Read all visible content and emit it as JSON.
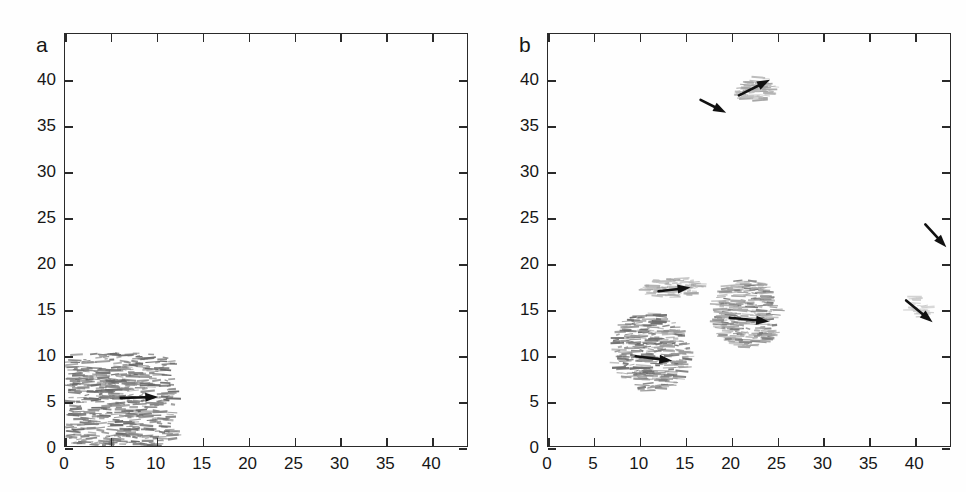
{
  "figure": {
    "background": "#fefefe",
    "axis_color": "#2a2a2a",
    "arrow_color": "#111111",
    "dash_color_dark": "#6f6f6f",
    "dash_color_light": "#a8a8a8"
  },
  "panels": [
    {
      "id": "a",
      "letter": "a"
    },
    {
      "id": "b",
      "letter": "b"
    }
  ],
  "chart_data": [
    {
      "type": "scatter",
      "panel": "a",
      "title": "a",
      "xlabel": "",
      "ylabel": "",
      "xlim": [
        0,
        44
      ],
      "ylim": [
        0,
        45
      ],
      "xticks": [
        0,
        5,
        10,
        15,
        20,
        25,
        30,
        35,
        40
      ],
      "yticks": [
        0,
        5,
        10,
        15,
        20,
        25,
        30,
        35,
        40
      ],
      "xticklabels": [
        "0",
        "5",
        "10",
        "15",
        "20",
        "25",
        "30",
        "35",
        "40"
      ],
      "yticklabels": [
        "0",
        "5",
        "10",
        "15",
        "20",
        "25",
        "30",
        "35",
        "40"
      ],
      "grid": false,
      "legend": "none",
      "marker_style": "short horizontal dash segments (streaks)",
      "clusters": [
        {
          "name": "main-cluster",
          "x_range": [
            0.4,
            11.9
          ],
          "y_range": [
            0.0,
            10.1
          ],
          "shade": "dark",
          "count": 520,
          "shape": "rectangular dense block"
        }
      ],
      "arrows": [
        {
          "name": "cluster-a-velocity-arrow",
          "x0": 6.1,
          "y0": 5.25,
          "x1": 10.2,
          "y1": 5.35
        }
      ]
    },
    {
      "type": "scatter",
      "panel": "b",
      "title": "b",
      "xlabel": "",
      "ylabel": "",
      "xlim": [
        0,
        44
      ],
      "ylim": [
        0,
        45
      ],
      "xticks": [
        0,
        5,
        10,
        15,
        20,
        25,
        30,
        35,
        40
      ],
      "yticks": [
        0,
        5,
        10,
        15,
        20,
        25,
        30,
        35,
        40
      ],
      "xticklabels": [
        "0",
        "5",
        "10",
        "15",
        "20",
        "25",
        "30",
        "35",
        "40"
      ],
      "yticklabels": [
        "0",
        "5",
        "10",
        "15",
        "20",
        "25",
        "30",
        "35",
        "40"
      ],
      "grid": false,
      "legend": "none",
      "marker_style": "short horizontal dash segments (streaks)",
      "clusters": [
        {
          "name": "upper-cluster",
          "x_center": 22.6,
          "y_center": 38.9,
          "x_range": [
            20.6,
            25.0
          ],
          "y_range": [
            37.6,
            40.2
          ],
          "shade": "light",
          "count": 60,
          "tilt_deg": 22,
          "shape": "small elongated blob tilted up-right"
        },
        {
          "name": "mid-left-cluster",
          "x_center": 11.0,
          "y_center": 10.4,
          "x_range": [
            7.0,
            15.5
          ],
          "y_range": [
            6.0,
            14.5
          ],
          "shade": "mixed-dark-left",
          "count": 300,
          "tilt_deg": -8,
          "shape": "diagonal elongated clump"
        },
        {
          "name": "mid-band-cluster",
          "x_center": 13.5,
          "y_center": 17.2,
          "x_range": [
            10.5,
            16.8
          ],
          "y_range": [
            16.2,
            18.4
          ],
          "shade": "light",
          "count": 85,
          "tilt_deg": 5,
          "shape": "thin elongated streak band"
        },
        {
          "name": "right-center-cluster",
          "x_center": 21.7,
          "y_center": 14.3,
          "x_range": [
            18.3,
            25.2
          ],
          "y_range": [
            10.7,
            18.3
          ],
          "shade": "mixed",
          "count": 260,
          "tilt_deg": -6,
          "shape": "oval clump"
        },
        {
          "name": "right-edge-faint-cluster",
          "x_center": 40.4,
          "y_center": 15.2,
          "x_range": [
            39.0,
            41.8
          ],
          "y_range": [
            14.1,
            16.3
          ],
          "shade": "very-light",
          "count": 22,
          "tilt_deg": -30,
          "shape": "faint diagonal wisp"
        }
      ],
      "arrows": [
        {
          "name": "upper-cluster-velocity-arrow",
          "x0": 20.9,
          "y0": 38.3,
          "x1": 24.3,
          "y1": 40.0
        },
        {
          "name": "upper-free-arrow",
          "x0": 16.7,
          "y0": 37.8,
          "x1": 19.5,
          "y1": 36.4
        },
        {
          "name": "mid-band-velocity-arrow",
          "x0": 12.1,
          "y0": 16.9,
          "x1": 15.6,
          "y1": 17.3
        },
        {
          "name": "mid-left-velocity-arrow",
          "x0": 9.6,
          "y0": 9.8,
          "x1": 13.6,
          "y1": 9.3
        },
        {
          "name": "right-center-velocity-arrow",
          "x0": 19.9,
          "y0": 14.0,
          "x1": 24.2,
          "y1": 13.6
        },
        {
          "name": "right-edge-upper-arrow",
          "x0": 41.3,
          "y0": 24.2,
          "x1": 43.6,
          "y1": 21.7
        },
        {
          "name": "right-edge-lower-arrow",
          "x0": 39.2,
          "y0": 15.9,
          "x1": 42.1,
          "y1": 13.5
        }
      ]
    }
  ]
}
